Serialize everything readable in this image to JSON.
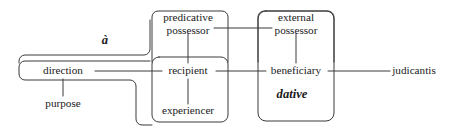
{
  "diagram": {
    "type": "semantic-map",
    "stroke_color": "#3a3a3a",
    "text_color": "#1a1a1a",
    "background_color": "#ffffff",
    "nodes": [
      {
        "id": "direction",
        "label": "direction",
        "label_line1": "direction",
        "label_line2": "",
        "x": 63,
        "y": 71
      },
      {
        "id": "purpose",
        "label": "purpose",
        "label_line1": "purpose",
        "label_line2": "",
        "x": 63,
        "y": 104
      },
      {
        "id": "predicative-possessor",
        "label": "predicative possessor",
        "label_line1": "predicative",
        "label_line2": "possessor",
        "x": 188,
        "y": 24
      },
      {
        "id": "recipient",
        "label": "recipient",
        "label_line1": "recipient",
        "label_line2": "",
        "x": 188,
        "y": 71
      },
      {
        "id": "experiencer",
        "label": "experiencer",
        "label_line1": "experiencer",
        "label_line2": "",
        "x": 188,
        "y": 111
      },
      {
        "id": "external-possessor",
        "label": "external possessor",
        "label_line1": "external",
        "label_line2": "possessor",
        "x": 296,
        "y": 24
      },
      {
        "id": "beneficiary",
        "label": "beneficiary",
        "label_line1": "beneficiary",
        "label_line2": "",
        "x": 296,
        "y": 71
      },
      {
        "id": "judicantis",
        "label": "judicantis",
        "label_line1": "judicantis",
        "label_line2": "",
        "x": 414,
        "y": 71
      }
    ],
    "region_labels": [
      {
        "id": "a-label",
        "label": "à",
        "x": 105,
        "y": 41
      },
      {
        "id": "dative-label",
        "label": "dative",
        "x": 292,
        "y": 95
      }
    ],
    "regions": [
      {
        "id": "region-a",
        "label": "à",
        "shape": "L-shaped rounded region"
      },
      {
        "id": "region-direction-purpose",
        "label": "direction / purpose",
        "shape": "rounded rectangle"
      },
      {
        "id": "region-predicative-possessor",
        "label": "predicative possessor",
        "shape": "rounded rectangle"
      },
      {
        "id": "region-recipient",
        "label": "recipient / experiencer",
        "shape": "rounded rectangle"
      },
      {
        "id": "region-external-possessor",
        "label": "external possessor",
        "shape": "rounded rectangle"
      },
      {
        "id": "region-dative",
        "label": "dative",
        "shape": "rounded rectangle"
      }
    ],
    "edges": [
      {
        "id": "edge-direction-recipient",
        "from": "direction",
        "to": "recipient",
        "orientation": "horizontal"
      },
      {
        "id": "edge-recipient-beneficiary",
        "from": "recipient",
        "to": "beneficiary",
        "orientation": "horizontal"
      },
      {
        "id": "edge-beneficiary-judicantis",
        "from": "beneficiary",
        "to": "judicantis",
        "orientation": "horizontal"
      },
      {
        "id": "edge-direction-purpose",
        "from": "direction",
        "to": "purpose",
        "orientation": "vertical"
      },
      {
        "id": "edge-predposs-recipient",
        "from": "predicative-possessor",
        "to": "recipient",
        "orientation": "vertical"
      },
      {
        "id": "edge-recipient-experiencer",
        "from": "recipient",
        "to": "experiencer",
        "orientation": "vertical"
      },
      {
        "id": "edge-extposs-beneficiary",
        "from": "external-possessor",
        "to": "beneficiary",
        "orientation": "vertical"
      },
      {
        "id": "edge-predposs-extposs",
        "from": "predicative-possessor",
        "to": "external-possessor",
        "orientation": "horizontal"
      }
    ]
  }
}
